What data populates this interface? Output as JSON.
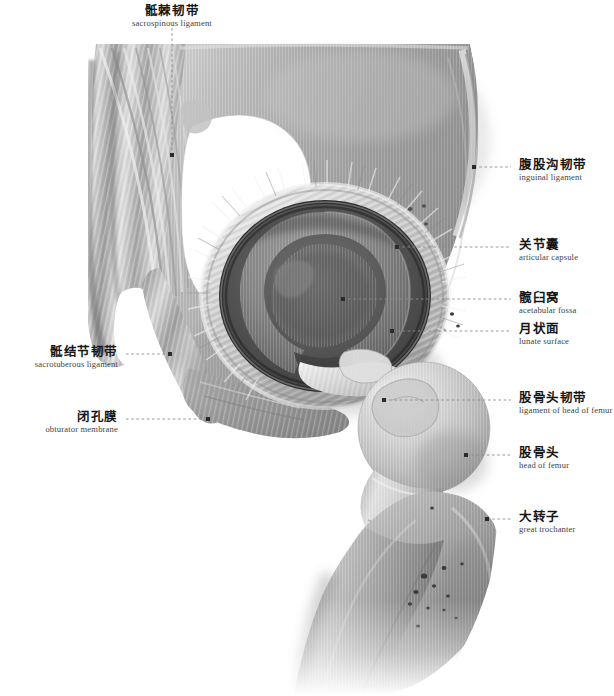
{
  "plate": {
    "title_cn": "髋关节",
    "title_en": "hip joint",
    "background_color": "#ffffff",
    "ink_color": "#161616",
    "leader_color": "#8c8c8c"
  },
  "labels": [
    {
      "id": "sacrospinous-ligament",
      "cn": "骶棘韧带",
      "en": "sacrospinous ligament",
      "side": "center",
      "text_x": 172,
      "text_y": 4,
      "anchor_x": 172,
      "anchor_y": 155
    },
    {
      "id": "inguinal-ligament",
      "cn": "腹股沟韧带",
      "en": "inguinal ligament",
      "side": "right",
      "text_x": 519,
      "text_y": 158,
      "anchor_x": 474,
      "anchor_y": 167
    },
    {
      "id": "articular-capsule",
      "cn": "关节囊",
      "en": "articular capsule",
      "side": "right",
      "text_x": 519,
      "text_y": 238,
      "anchor_x": 397,
      "anchor_y": 247
    },
    {
      "id": "acetabular-fossa",
      "cn": "髋臼窝",
      "en": "acetabular fossa",
      "side": "right",
      "text_x": 519,
      "text_y": 291,
      "anchor_x": 343,
      "anchor_y": 299
    },
    {
      "id": "lunate-surface",
      "cn": "月状面",
      "en": "lunate surface",
      "side": "right",
      "text_x": 519,
      "text_y": 322,
      "anchor_x": 392,
      "anchor_y": 331
    },
    {
      "id": "ligament-of-head-of-femur",
      "cn": "股骨头韧带",
      "en": "ligament of head of femur",
      "side": "right",
      "text_x": 519,
      "text_y": 391,
      "anchor_x": 384,
      "anchor_y": 400
    },
    {
      "id": "head-of-femur",
      "cn": "股骨头",
      "en": "head of femur",
      "side": "right",
      "text_x": 519,
      "text_y": 446,
      "anchor_x": 466,
      "anchor_y": 455
    },
    {
      "id": "great-trochanter",
      "cn": "大转子",
      "en": "great trochanter",
      "side": "right",
      "text_x": 519,
      "text_y": 510,
      "anchor_x": 487,
      "anchor_y": 519
    },
    {
      "id": "sacrotuberous-ligament",
      "cn": "骶结节韧带",
      "en": "sacrotuberous ligament",
      "side": "left",
      "text_x": 118,
      "text_y": 345,
      "anchor_x": 170,
      "anchor_y": 354
    },
    {
      "id": "obturator-membrane",
      "cn": "闭孔膜",
      "en": "obturator membrane",
      "side": "left",
      "text_x": 118,
      "text_y": 410,
      "anchor_x": 208,
      "anchor_y": 419
    }
  ],
  "structures": [
    {
      "id": "ilium",
      "cn": "髂骨",
      "en": "ilium"
    },
    {
      "id": "obturator-foramen",
      "cn": "闭孔",
      "en": "obturator foramen"
    },
    {
      "id": "greater-sciatic-notch",
      "cn": "坐骨大孔",
      "en": "greater sciatic foramen"
    },
    {
      "id": "acetabulum",
      "cn": "髋臼",
      "en": "acetabulum"
    },
    {
      "id": "femoral-neck",
      "cn": "股骨颈",
      "en": "neck of femur"
    },
    {
      "id": "femoral-shaft",
      "cn": "股骨体",
      "en": "shaft of femur"
    }
  ]
}
